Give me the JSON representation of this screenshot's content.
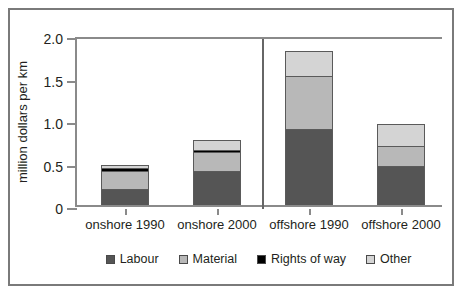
{
  "chart_data": {
    "type": "bar",
    "subtype": "stacked-bar",
    "title": "",
    "subtitle": "",
    "xlabel": "",
    "ylabel": "million dollars per km",
    "ylim": [
      0,
      2.0
    ],
    "yticks": [
      "0",
      "0.5",
      "1.0",
      "1.5",
      "2.0"
    ],
    "ytick_values": [
      0,
      0.5,
      1.0,
      1.5,
      2.0
    ],
    "grid": false,
    "legend_position": "bottom",
    "group_divider_after_category": 2,
    "categories": [
      "onshore 1990",
      "onshore 2000",
      "offshore 1990",
      "offshore 2000"
    ],
    "series": [
      {
        "name": "Labour",
        "color": "#555555",
        "values": [
          0.19,
          0.4,
          0.89,
          0.46
        ]
      },
      {
        "name": "Material",
        "color": "#b8b8b8",
        "values": [
          0.21,
          0.22,
          0.63,
          0.24
        ]
      },
      {
        "name": "Rights of way",
        "color": "#000000",
        "values": [
          0.03,
          0.03,
          0.0,
          0.0
        ]
      },
      {
        "name": "Other",
        "color": "#d4d4d4",
        "values": [
          0.04,
          0.11,
          0.29,
          0.25
        ]
      }
    ],
    "totals": [
      0.47,
      0.76,
      1.81,
      0.95
    ]
  },
  "legend": {
    "items": [
      {
        "label": "Labour"
      },
      {
        "label": "Material"
      },
      {
        "label": "Rights of way"
      },
      {
        "label": "Other"
      }
    ]
  }
}
